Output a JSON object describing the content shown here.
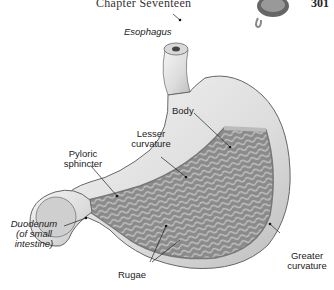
{
  "header": {
    "chapter_title": "Chapter Seventeen",
    "page_number": "301"
  },
  "figure": {
    "labels": {
      "esophagus": "Esophagus",
      "body": "Body",
      "lesser_curvature_1": "Lesser",
      "lesser_curvature_2": "curvature",
      "pyloric_sphincter_1": "Pyloric",
      "pyloric_sphincter_2": "sphincter",
      "duodenum_1": "Duodenum",
      "duodenum_2": "(of small",
      "duodenum_3": "intestine)",
      "rugae": "Rugae",
      "greater_curvature_1": "Greater",
      "greater_curvature_2": "curvature"
    }
  }
}
